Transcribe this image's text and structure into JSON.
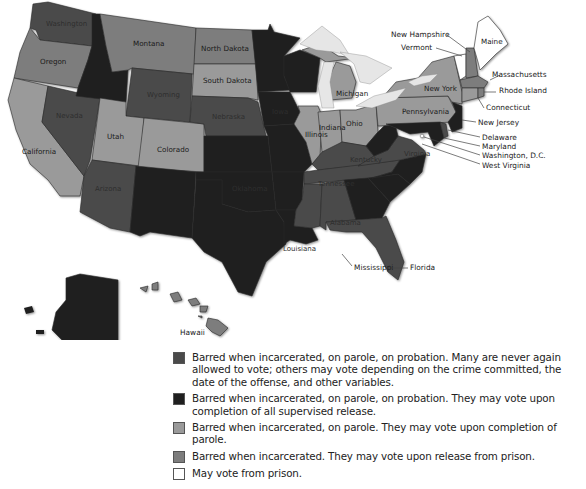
{
  "colors": {
    "cat1_permanent": "#4a4a4a",
    "cat2_supervised": "#1f1f1f",
    "cat3_parole": "#9a9a9a",
    "cat4_prison": "#7d7d7d",
    "cat5_never": "#ffffff",
    "lakes": "#e6e6e6"
  },
  "states": {
    "washington": {
      "label": "Washington",
      "category": 1
    },
    "oregon": {
      "label": "Oregon",
      "category": 4
    },
    "california": {
      "label": "California",
      "category": 3
    },
    "nevada": {
      "label": "Nevada",
      "category": 1
    },
    "idaho": {
      "label": "Idaho",
      "category": 2
    },
    "montana": {
      "label": "Montana",
      "category": 4
    },
    "wyoming": {
      "label": "Wyoming",
      "category": 1
    },
    "utah": {
      "label": "Utah",
      "category": 3
    },
    "colorado": {
      "label": "Colorado",
      "category": 3
    },
    "arizona": {
      "label": "Arizona",
      "category": 1
    },
    "new_mexico": {
      "label": "New Mexico",
      "category": 2
    },
    "north_dakota": {
      "label": "North Dakota",
      "category": 4
    },
    "south_dakota": {
      "label": "South Dakota",
      "category": 3
    },
    "nebraska": {
      "label": "Nebraska",
      "category": 1
    },
    "kansas": {
      "label": "Kansas",
      "category": 2
    },
    "oklahoma": {
      "label": "Oklahoma",
      "category": 2
    },
    "texas": {
      "label": "Texas",
      "category": 2
    },
    "minnesota": {
      "label": "Minnesota",
      "category": 2
    },
    "iowa": {
      "label": "Iowa",
      "category": 2
    },
    "missouri": {
      "label": "Missouri",
      "category": 2
    },
    "arkansas": {
      "label": "Arkansas",
      "category": 2
    },
    "louisiana": {
      "label": "Louisiana",
      "category": 2
    },
    "wisconsin": {
      "label": "Wisconsin",
      "category": 2
    },
    "illinois": {
      "label": "Illinois",
      "category": 3
    },
    "michigan": {
      "label": "Michigan",
      "category": 3
    },
    "indiana": {
      "label": "Indiana",
      "category": 3
    },
    "ohio": {
      "label": "Ohio",
      "category": 3
    },
    "kentucky": {
      "label": "Kentucky",
      "category": 1
    },
    "tennessee": {
      "label": "Tennessee",
      "category": 1
    },
    "mississippi": {
      "label": "Mississippi",
      "category": 1
    },
    "alabama": {
      "label": "Alabama",
      "category": 1
    },
    "georgia": {
      "label": "Georgia",
      "category": 2
    },
    "florida": {
      "label": "Florida",
      "category": 1
    },
    "south_carolina": {
      "label": "South Carolina",
      "category": 2
    },
    "north_carolina": {
      "label": "North Carolina",
      "category": 2
    },
    "virginia": {
      "label": "Virginia",
      "category": 1
    },
    "west_virginia": {
      "label": "West Virginia",
      "category": 2
    },
    "pennsylvania": {
      "label": "Pennsylvania",
      "category": 3
    },
    "new_york": {
      "label": "New York",
      "category": 3
    },
    "new_jersey": {
      "label": "New Jersey",
      "category": 2
    },
    "delaware": {
      "label": "Delaware",
      "category": 1
    },
    "maryland": {
      "label": "Maryland",
      "category": 2
    },
    "dc": {
      "label": "Washington, D.C.",
      "category": 5
    },
    "connecticut": {
      "label": "Connecticut",
      "category": 3
    },
    "rhode_island": {
      "label": "Rhode Island",
      "category": 4
    },
    "massachusetts": {
      "label": "Massachusetts",
      "category": 4
    },
    "vermont": {
      "label": "Vermont",
      "category": 5
    },
    "new_hampshire": {
      "label": "New Hampshire",
      "category": 4
    },
    "maine": {
      "label": "Maine",
      "category": 5
    },
    "alaska": {
      "label": "Alaska",
      "category": 2
    },
    "hawaii": {
      "label": "Hawaii",
      "category": 4
    }
  },
  "callouts": {
    "new_hampshire": "New Hampshire",
    "vermont": "Vermont",
    "massachusetts": "Massachusetts",
    "rhode_island": "Rhode Island",
    "connecticut": "Connecticut",
    "new_jersey": "New Jersey",
    "delaware": "Delaware",
    "maryland": "Maryland",
    "dc": "Washington, D.C.",
    "west_virginia": "West Virginia",
    "mississippi": "Mississippi",
    "florida": "Florida",
    "hawaii": "Hawaii"
  },
  "inline_labels": {
    "washington": "Washington",
    "oregon": "Oregon",
    "california": "California",
    "nevada": "Nevada",
    "montana": "Montana",
    "wyoming": "Wyoming",
    "utah": "Utah",
    "colorado": "Colorado",
    "arizona": "Arizona",
    "north_dakota": "North Dakota",
    "south_dakota": "South Dakota",
    "nebraska": "Nebraska",
    "oklahoma": "Oklahoma",
    "illinois": "Illinois",
    "indiana": "Indiana",
    "ohio": "Ohio",
    "michigan": "Michigan",
    "new_york": "New York",
    "pennsylvania": "Pennsylvania",
    "maine": "Maine",
    "kentucky": "Kentucky",
    "tennessee": "Tennessee",
    "virginia": "Virginia",
    "alabama": "Alabama",
    "louisiana": "Louisiana",
    "iowa": "Iowa"
  },
  "legend": [
    {
      "category": 1,
      "color": "#4a4a4a",
      "text": "Barred when incarcerated, on parole, on probation. Many are never again allowed to vote; others may vote depending on the crime committed, the date of the offense, and other variables."
    },
    {
      "category": 2,
      "color": "#1f1f1f",
      "text": "Barred when incarcerated, on parole, on probation. They may vote upon completion of all supervised release."
    },
    {
      "category": 3,
      "color": "#9a9a9a",
      "text": "Barred when incarcerated, on parole. They may vote upon completion of parole."
    },
    {
      "category": 4,
      "color": "#7d7d7d",
      "text": "Barred when incarcerated. They may vote upon release from prison."
    },
    {
      "category": 5,
      "color": "#ffffff",
      "text": "May vote from prison."
    }
  ]
}
